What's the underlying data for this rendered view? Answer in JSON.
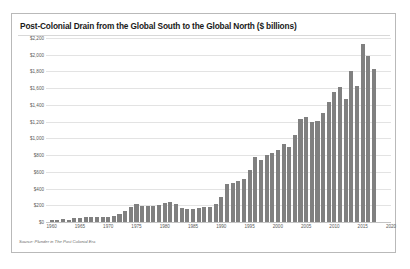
{
  "card": {
    "title": "Post-Colonial Drain from the Global South to the Global North ($ billions)",
    "source_note": "Source: Plunder in The Post Colonial Era"
  },
  "style": {
    "bar_color": "#808080",
    "grid_color": "#e3e3e3",
    "axis_color": "#c4c4c4",
    "border_color": "#b9b9b9",
    "text_color": "#5a5a5a",
    "title_color": "#1a1a1a",
    "background": "#ffffff"
  },
  "chart_data": {
    "type": "bar",
    "title": "Post-Colonial Drain from the Global South to the Global North ($ billions)",
    "xlabel": "",
    "ylabel": "",
    "ylim": [
      0,
      2200
    ],
    "xlim": [
      1959,
      2020
    ],
    "grid": true,
    "legend": false,
    "ytick_labels": [
      "$2,200",
      "$2,000",
      "$1,800",
      "$1,600",
      "$1,400",
      "$1,200",
      "$1,000",
      "$800",
      "$600",
      "$400",
      "$200",
      "$0"
    ],
    "ytick_values": [
      2200,
      2000,
      1800,
      1600,
      1400,
      1200,
      1000,
      800,
      600,
      400,
      200,
      0
    ],
    "xtick_labels": [
      "1960",
      "1965",
      "1970",
      "1975",
      "1980",
      "1985",
      "1990",
      "1995",
      "2000",
      "2005",
      "2010",
      "2015",
      "2020"
    ],
    "xtick_values": [
      1960,
      1965,
      1970,
      1975,
      1980,
      1985,
      1990,
      1995,
      2000,
      2005,
      2010,
      2015,
      2020
    ],
    "categories": [
      "1960",
      "1961",
      "1962",
      "1963",
      "1964",
      "1965",
      "1966",
      "1967",
      "1968",
      "1969",
      "1970",
      "1971",
      "1972",
      "1973",
      "1974",
      "1975",
      "1976",
      "1977",
      "1978",
      "1979",
      "1980",
      "1981",
      "1982",
      "1983",
      "1984",
      "1985",
      "1986",
      "1987",
      "1988",
      "1989",
      "1990",
      "1991",
      "1992",
      "1993",
      "1994",
      "1995",
      "1996",
      "1997",
      "1998",
      "1999",
      "2000",
      "2001",
      "2002",
      "2003",
      "2004",
      "2005",
      "2006",
      "2007",
      "2008",
      "2009",
      "2010",
      "2011",
      "2012",
      "2013",
      "2014",
      "2015",
      "2016",
      "2017"
    ],
    "values": [
      30,
      28,
      32,
      30,
      45,
      48,
      62,
      60,
      58,
      60,
      62,
      75,
      95,
      130,
      185,
      215,
      190,
      190,
      195,
      205,
      230,
      240,
      210,
      165,
      155,
      160,
      165,
      175,
      180,
      215,
      300,
      450,
      470,
      490,
      520,
      620,
      780,
      740,
      800,
      830,
      860,
      930,
      900,
      1040,
      1230,
      1250,
      1190,
      1210,
      1300,
      1440,
      1560,
      1620,
      1470,
      1800,
      1630,
      2130,
      1990,
      1830
    ]
  }
}
